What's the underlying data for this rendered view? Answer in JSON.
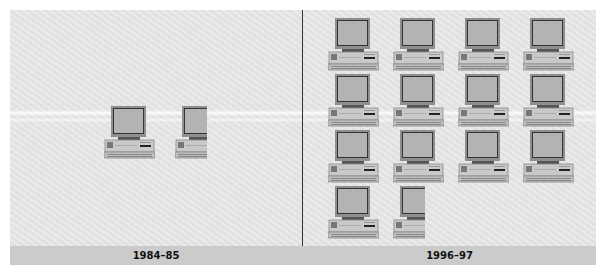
{
  "chart_data": {
    "type": "pictograph",
    "title": "",
    "unit_icon": "computer-icon",
    "categories": [
      "1984–85",
      "1996–97"
    ],
    "values": [
      1.5,
      13.5
    ],
    "xlabel": "",
    "ylabel": "",
    "layout": {
      "left_panel": {
        "rows": 1,
        "cols": 2,
        "last_icon_fraction": 0.5
      },
      "right_panel": {
        "rows": 4,
        "cols": 4,
        "last_icon_fraction": 0.5
      }
    }
  },
  "labels": {
    "left": "1984–85",
    "right": "1996–97"
  },
  "colors": {
    "background": "#e6e6e6",
    "label_bar": "#cbcbcb",
    "monitor_frame": "#8f8f8f",
    "screen": "#b5b5b5",
    "divider": "#333333"
  }
}
